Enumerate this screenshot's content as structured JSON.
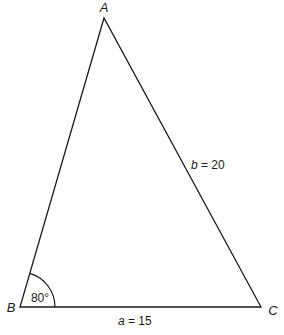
{
  "diagram": {
    "type": "triangle",
    "vertices": {
      "A": {
        "label": "A"
      },
      "B": {
        "label": "B"
      },
      "C": {
        "label": "C"
      }
    },
    "sides": {
      "a": {
        "var": "a",
        "eq": " = 15",
        "value": 15,
        "between": [
          "B",
          "C"
        ]
      },
      "b": {
        "var": "b",
        "eq": " = 20",
        "value": 20,
        "between": [
          "A",
          "C"
        ]
      }
    },
    "angles": {
      "B": {
        "label": "80°",
        "value_degrees": 80
      }
    },
    "colors": {
      "stroke": "#1a1a1a",
      "background": "#ffffff"
    }
  }
}
